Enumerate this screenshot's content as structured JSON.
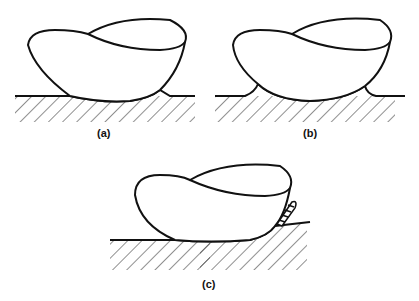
{
  "figure": {
    "panels": [
      {
        "id": "a",
        "label": "(a)",
        "description": "Droplet resting on flat surface with wetting on the right edge only"
      },
      {
        "id": "b",
        "label": "(b)",
        "description": "Droplet resting on flat surface with meniscus on both edges"
      },
      {
        "id": "c",
        "label": "(c)",
        "description": "Droplet on surface with helical/spiral structure at right contact"
      }
    ]
  },
  "colors": {
    "stroke": "#111111",
    "background": "#ffffff"
  }
}
